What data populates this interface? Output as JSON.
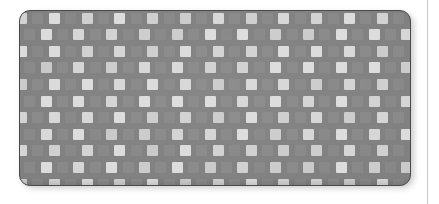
{
  "scene": {
    "label": "product-photo",
    "background_color": "#ffffff",
    "description": "Gray rectangular mat with rounded corners and an all-over pattern of light squares"
  },
  "page_rule": {
    "label": "page-divider-line",
    "color": "#c8c8c8",
    "x": 427,
    "width": 1
  },
  "mat": {
    "label": "patterned mat",
    "base_color": "#808080",
    "border_color": "#4a4a4a",
    "shadow_color": "#b9b9b9",
    "corner_radius": 11,
    "x": 19,
    "y": 10,
    "width": 392,
    "height": 176
  },
  "pattern": {
    "name": "checkerboard-squares",
    "cell_width": 16.4,
    "cell_height": 16.6,
    "square_size": 11,
    "bright_color": "#dcdcdc",
    "dim_color": "#8f8f8f",
    "bright_opacity": 0.95,
    "dim_opacity": 0.55,
    "columns": 25,
    "rows": 12
  }
}
